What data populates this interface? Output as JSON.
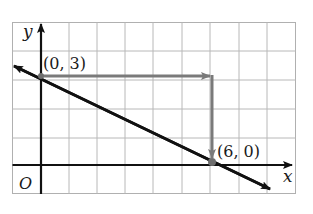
{
  "diagram": {
    "type": "coordinate-plane-line",
    "axes": {
      "x_label": "x",
      "y_label": "y",
      "origin_label": "O"
    },
    "grid": {
      "x_min": -1,
      "x_max": 9,
      "y_min": -1,
      "y_max": 5,
      "cell_px": 28.4
    },
    "points": [
      {
        "label": "(0, 3)",
        "x": 0,
        "y": 3
      },
      {
        "label": "(6, 0)",
        "x": 6,
        "y": 0
      }
    ],
    "line": {
      "slope": -0.5,
      "y_intercept": 3,
      "description": "line through (0,3) and (6,0)"
    },
    "path_arrows": [
      {
        "from": [
          0,
          3
        ],
        "to": [
          6,
          3
        ],
        "note": "run +6"
      },
      {
        "from": [
          6,
          3
        ],
        "to": [
          6,
          0
        ],
        "note": "rise -3"
      }
    ],
    "colors": {
      "grid": "#b8b8b8",
      "axes": "#111111",
      "line": "#111111",
      "path_arrow": "#7a7a7a",
      "point": "#6e6e6e"
    }
  }
}
